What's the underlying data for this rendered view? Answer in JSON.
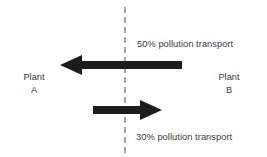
{
  "diagram": {
    "type": "flow-diagram",
    "canvas": {
      "width": 267,
      "height": 157,
      "background": "#ffffff"
    },
    "boundary": {
      "name": "region-boundary",
      "orientation": "vertical",
      "style": "dashed",
      "color": "#a8a8a8"
    },
    "nodes": [
      {
        "id": "plant-a",
        "name_line1": "Plant",
        "name_line2": "A",
        "side": "left"
      },
      {
        "id": "plant-b",
        "name_line1": "Plant",
        "name_line2": "B",
        "side": "right"
      }
    ],
    "flows": [
      {
        "id": "flow-b-to-a",
        "label": "50% pollution transport",
        "percent": 50,
        "direction": "left",
        "from": "Plant B",
        "to": "Plant A",
        "color": "#1c1c1c"
      },
      {
        "id": "flow-a-to-b",
        "label": "30% pollution transport",
        "percent": 30,
        "direction": "right",
        "from": "Plant A",
        "to": "Plant B",
        "color": "#1c1c1c"
      }
    ],
    "colors": {
      "arrow": "#1c1c1c",
      "text": "#3c3c3c",
      "boundary": "#a8a8a8"
    }
  }
}
